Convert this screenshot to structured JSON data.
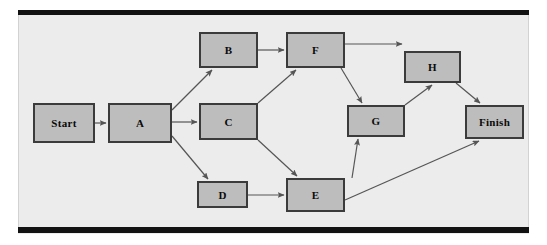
{
  "diagram": {
    "type": "directed-graph",
    "background_color": "#ececec",
    "node_fill_color": "#bdbdbd",
    "node_border_color": "#3b3b3b",
    "edge_color": "#555555",
    "frame_bar_color": "#121212",
    "nodes": [
      {
        "id": "start",
        "label": "Start",
        "x": 33,
        "y": 103,
        "w": 62,
        "h": 40
      },
      {
        "id": "a",
        "label": "A",
        "x": 108,
        "y": 103,
        "w": 64,
        "h": 40
      },
      {
        "id": "b",
        "label": "B",
        "x": 199,
        "y": 32,
        "w": 59,
        "h": 36
      },
      {
        "id": "c",
        "label": "C",
        "x": 199,
        "y": 103,
        "w": 59,
        "h": 37
      },
      {
        "id": "d",
        "label": "D",
        "x": 197,
        "y": 181,
        "w": 51,
        "h": 27
      },
      {
        "id": "e",
        "label": "E",
        "x": 286,
        "y": 178,
        "w": 59,
        "h": 34
      },
      {
        "id": "f",
        "label": "F",
        "x": 286,
        "y": 32,
        "w": 59,
        "h": 36
      },
      {
        "id": "g",
        "label": "G",
        "x": 347,
        "y": 105,
        "w": 58,
        "h": 32
      },
      {
        "id": "h",
        "label": "H",
        "x": 404,
        "y": 51,
        "w": 57,
        "h": 32
      },
      {
        "id": "finish",
        "label": "Finish",
        "x": 465,
        "y": 105,
        "w": 59,
        "h": 34
      }
    ],
    "edges": [
      {
        "from": "start",
        "to": "a",
        "x1": 95,
        "y1": 123,
        "x2": 106,
        "y2": 123
      },
      {
        "from": "a",
        "to": "b",
        "x1": 172,
        "y1": 110,
        "x2": 212,
        "y2": 70
      },
      {
        "from": "a",
        "to": "c",
        "x1": 172,
        "y1": 122,
        "x2": 197,
        "y2": 122
      },
      {
        "from": "a",
        "to": "d",
        "x1": 172,
        "y1": 136,
        "x2": 208,
        "y2": 179
      },
      {
        "from": "b",
        "to": "f",
        "x1": 258,
        "y1": 50,
        "x2": 284,
        "y2": 50
      },
      {
        "from": "c",
        "to": "f",
        "x1": 258,
        "y1": 103,
        "x2": 296,
        "y2": 70
      },
      {
        "from": "c",
        "to": "e",
        "x1": 258,
        "y1": 140,
        "x2": 297,
        "y2": 176
      },
      {
        "from": "d",
        "to": "e",
        "x1": 248,
        "y1": 195,
        "x2": 284,
        "y2": 195
      },
      {
        "from": "f",
        "to": "h",
        "x1": 345,
        "y1": 44,
        "x2": 402,
        "y2": 44
      },
      {
        "from": "f",
        "to": "g",
        "x1": 341,
        "y1": 68,
        "x2": 362,
        "y2": 103
      },
      {
        "from": "e",
        "to": "g",
        "x1": 352,
        "y1": 178,
        "x2": 358,
        "y2": 139
      },
      {
        "from": "g",
        "to": "h",
        "x1": 405,
        "y1": 105,
        "x2": 432,
        "y2": 85
      },
      {
        "from": "h",
        "to": "finish",
        "x1": 456,
        "y1": 83,
        "x2": 480,
        "y2": 103
      },
      {
        "from": "e",
        "to": "finish",
        "x1": 345,
        "y1": 200,
        "x2": 479,
        "y2": 141
      }
    ]
  }
}
